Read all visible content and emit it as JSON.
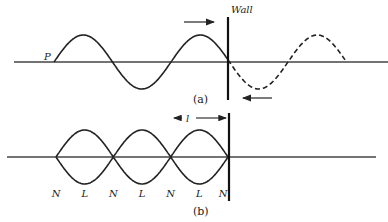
{
  "figure_a": {
    "caption": "(a)",
    "wall_label": "Wall",
    "point_label": "P",
    "incident_direction": "right",
    "reflected_direction": "left",
    "incident_wave": "solid",
    "reflected_wave": "dashed"
  },
  "figure_b": {
    "caption": "(b)",
    "length_label": "l",
    "node_labels": [
      "N",
      "L",
      "N",
      "L",
      "N",
      "L",
      "N"
    ]
  },
  "colors": {
    "ink": "#222222",
    "axis": "#444444",
    "background": "#ffffff"
  }
}
